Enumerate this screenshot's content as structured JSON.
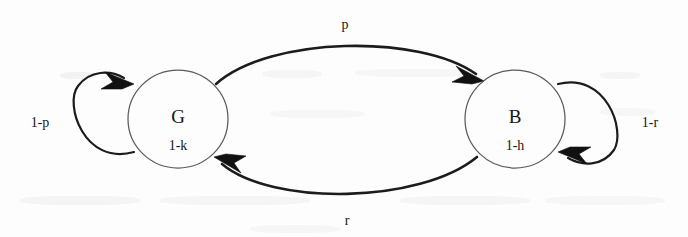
{
  "diagram": {
    "type": "state-transition-diagram",
    "title": "",
    "nodes": [
      {
        "id": "G",
        "label": "G",
        "sublabel": "1-k",
        "cx": 178,
        "cy": 119,
        "rx": 50,
        "ry": 49
      },
      {
        "id": "B",
        "label": "B",
        "sublabel": "1-h",
        "cx": 515,
        "cy": 119,
        "rx": 50,
        "ry": 49
      }
    ],
    "edges": [
      {
        "id": "g-to-b",
        "from": "G",
        "to": "B",
        "label": "p",
        "label_x": 345,
        "label_y": 26,
        "position": "top"
      },
      {
        "id": "b-to-g",
        "from": "B",
        "to": "G",
        "label": "r",
        "label_x": 347,
        "label_y": 222,
        "position": "bottom"
      },
      {
        "id": "g-self-loop",
        "from": "G",
        "to": "G",
        "label": "1-p",
        "label_x": 40,
        "label_y": 124,
        "position": "left"
      },
      {
        "id": "b-self-loop",
        "from": "B",
        "to": "B",
        "label": "1-r",
        "label_x": 650,
        "label_y": 124,
        "position": "right"
      }
    ],
    "colors": {
      "stroke": "#1c1c1c",
      "node_stroke": "#5b5b5b",
      "text": "#161616",
      "background": "#fdfdfd"
    }
  }
}
